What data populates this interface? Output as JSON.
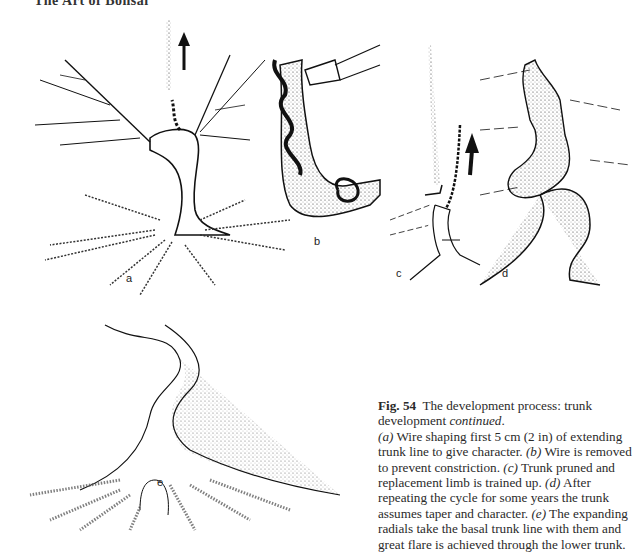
{
  "page": {
    "running_head": "The Art of Bonsai"
  },
  "figure": {
    "panels": [
      {
        "id": "a",
        "label": "a",
        "description": "tree with wired extending trunk line and upward arrow"
      },
      {
        "id": "b",
        "label": "b",
        "description": "close-up of wire around trunk being removed"
      },
      {
        "id": "c",
        "label": "c",
        "description": "trunk pruned with replacement limb trained up, upward arrow"
      },
      {
        "id": "d",
        "label": "d",
        "description": "trunk after repeated cycles showing taper and character"
      },
      {
        "id": "e",
        "label": "e",
        "description": "basal trunk flare with expanding radials"
      }
    ],
    "caption": {
      "number": "Fig. 54",
      "title": "The development process: trunk development",
      "title_emph": "continued",
      "title_end": ".",
      "parts": [
        {
          "label": "(a)",
          "text": " Wire shaping first 5 cm (2 in) of extending trunk line to give character. "
        },
        {
          "label": "(b)",
          "text": " Wire is removed to prevent constriction. "
        },
        {
          "label": "(c)",
          "text": " Trunk pruned and replacement limb is trained up. "
        },
        {
          "label": "(d)",
          "text": " After repeating the cycle for some years the trunk assumes taper and character. "
        },
        {
          "label": "(e)",
          "text": " The expanding radials take the basal trunk line with them and great flare is achieved through the lower trunk."
        }
      ]
    }
  }
}
